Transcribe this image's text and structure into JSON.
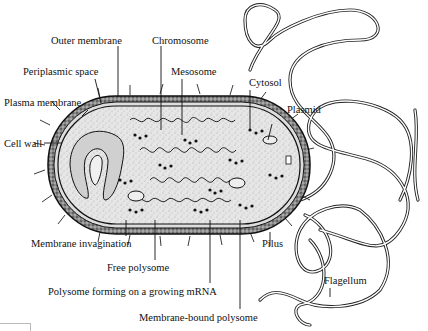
{
  "diagram": {
    "labels": {
      "outer_membrane": "Outer membrane",
      "chromosome": "Chromosome",
      "periplasmic_space": "Periplasmic space",
      "mesosome": "Mesosome",
      "cytosol": "Cytosol",
      "plasma_membrane": "Plasma membrane",
      "plasmid": "Plasmid",
      "cell_wall": "Cell wall",
      "membrane_invagination": "Membrane invagination",
      "pilus": "Pilus",
      "free_polysome": "Free polysome",
      "flagellum": "Flagellum",
      "polysome_growing_mrna": "Polysome forming on a growing mRNA",
      "membrane_bound_polysome": "Membrane-bound polysome"
    },
    "colors": {
      "line": "#1a1a1a",
      "cell_wall_fill": "#7a7a7a",
      "cytoplasm_fill": "#e4e4e4",
      "background": "#ffffff"
    }
  }
}
